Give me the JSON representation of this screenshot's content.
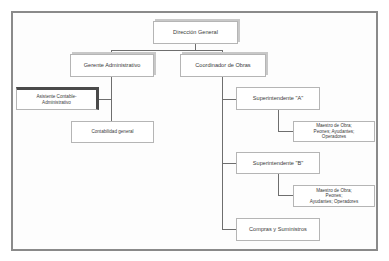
{
  "chart": {
    "nodes": {
      "direccion": {
        "label": "Dirección General"
      },
      "gerente": {
        "label": "Gerente Administrativo"
      },
      "coordinador": {
        "label": "Coordinador de Obras"
      },
      "asistente": {
        "label": "Asistente Contable-Administrativo",
        "line1": "Asistente Contable-",
        "line2": "Administrativo"
      },
      "contabilidad": {
        "label": "Contabilidad general"
      },
      "sup_a": {
        "label": "Superintendente \"A\""
      },
      "maestro_a": {
        "line1": "Maestro de Obra;",
        "line2": "Peones; Ayudantes;",
        "line3": "Operadores"
      },
      "sup_b": {
        "label": "Superintendente \"B\""
      },
      "maestro_b": {
        "line1": "Maestro de Obra;",
        "line2": "Peones;",
        "line3": "Ayudantes; Operadores"
      },
      "compras": {
        "label": "Compras y Suministros"
      }
    },
    "colors": {
      "frame": "#8a8a8a",
      "box_border": "#b5b5b5",
      "connector": "#6e6e6e",
      "dark_shadow": "#4a4a4a"
    }
  }
}
